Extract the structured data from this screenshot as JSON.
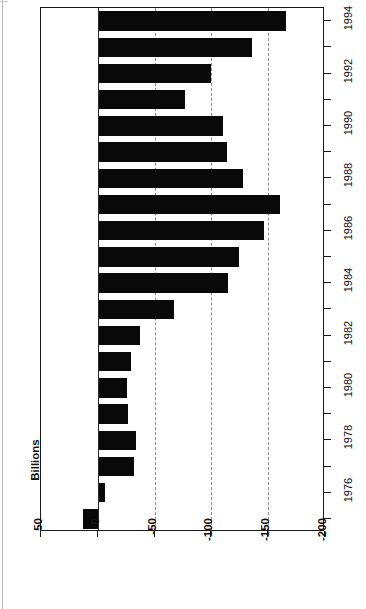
{
  "chart_data": {
    "type": "bar",
    "orientation": "rotated-90-ccw",
    "title": "",
    "subtitle": "",
    "xlabel": "",
    "ylabel": "Billions",
    "categories": [
      1975,
      1976,
      1977,
      1978,
      1979,
      1980,
      1981,
      1982,
      1983,
      1984,
      1985,
      1986,
      1987,
      1988,
      1989,
      1990,
      1991,
      1992,
      1993,
      1994
    ],
    "values": [
      13,
      -6,
      -32,
      -34,
      -27,
      -26,
      -29,
      -37,
      -67,
      -115,
      -124,
      -146,
      -160,
      -128,
      -114,
      -110,
      -77,
      -100,
      -136,
      -166
    ],
    "series": [
      {
        "name": "Federal budget deficit",
        "values": [
          13,
          -6,
          -32,
          -34,
          -27,
          -26,
          -29,
          -37,
          -67,
          -115,
          -124,
          -146,
          -160,
          -128,
          -114,
          -110,
          -77,
          -100,
          -136,
          -166
        ]
      }
    ],
    "ylim": [
      50,
      -200
    ],
    "value_ticks": [
      50,
      0,
      -50,
      -100,
      -150,
      -200
    ],
    "value_tick_labels": [
      "50",
      "0",
      "-50",
      "-100",
      "-150",
      "-200"
    ],
    "category_tick_labels": [
      "1994",
      "",
      "1992",
      "",
      "1990",
      "",
      "1988",
      "",
      "1986",
      "",
      "1984",
      "",
      "1982",
      "",
      "1980",
      "",
      "1978",
      "",
      "1976",
      ""
    ],
    "grid": "dashed vertical at -50, -100, -150",
    "legend": "none",
    "bar_color": "#090909",
    "grid_color": "#8d8d8d",
    "axis_color": "#1a1a1a"
  },
  "axis": {
    "value_title": "Billions"
  }
}
